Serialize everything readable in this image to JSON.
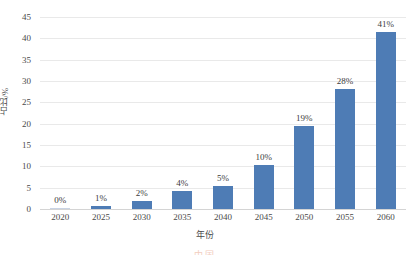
{
  "chart_data": {
    "type": "bar",
    "title": "",
    "xlabel": "年份",
    "ylabel": "占比/%",
    "categories": [
      "2020",
      "2025",
      "2030",
      "2035",
      "2040",
      "2045",
      "2050",
      "2055",
      "2060"
    ],
    "values": [
      0.15,
      0.6,
      1.9,
      4.2,
      5.5,
      10.3,
      19.4,
      28.1,
      41.6
    ],
    "data_labels": [
      "0%",
      "1%",
      "2%",
      "4%",
      "5%",
      "10%",
      "19%",
      "28%",
      "41%"
    ],
    "ylim": [
      0,
      45
    ],
    "ytick_labels": [
      "0",
      "5",
      "10",
      "15",
      "20",
      "25",
      "30",
      "35",
      "40",
      "45"
    ],
    "ytick_values": [
      0,
      5,
      10,
      15,
      20,
      25,
      30,
      35,
      40,
      45
    ],
    "grid": "horizontal",
    "legend": "none",
    "series": [
      {
        "name": "占比/%",
        "color": "#4e7cb5",
        "values": [
          0.15,
          0.6,
          1.9,
          4.2,
          5.5,
          10.3,
          19.4,
          28.1,
          41.6
        ]
      }
    ]
  },
  "watermark": {
    "text": "中国"
  }
}
